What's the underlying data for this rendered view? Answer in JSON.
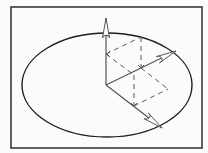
{
  "diagram": {
    "type": "vector-parallelepiped-in-ellipse",
    "colors": {
      "background": "#fbfbfb",
      "frame": "#3a3a3a",
      "ellipse": "#1e1e1e",
      "vector": "#555555",
      "dashed": "#5a5a5a",
      "arrowhead_fill": "#ffffff"
    },
    "frame": {
      "x": 11,
      "y": 7,
      "width": 191,
      "height": 141
    },
    "ellipse": {
      "cx": 107,
      "cy": 85,
      "rx": 85,
      "ry": 52
    },
    "origin": {
      "x": 106,
      "y": 85
    },
    "vectors": [
      {
        "name": "vertical-vector",
        "tip": {
          "x": 106,
          "y": 18
        }
      },
      {
        "name": "right-vector",
        "tip": {
          "x": 176,
          "y": 51
        }
      },
      {
        "name": "down-right-vector",
        "tip": {
          "x": 162,
          "y": 128
        }
      }
    ],
    "dashed_edges": [
      {
        "name": "a-to-ab",
        "x1": 106,
        "y1": 54,
        "x2": 141,
        "y2": 37
      },
      {
        "name": "ab-to-b",
        "x1": 141,
        "y1": 37,
        "x2": 141,
        "y2": 68
      },
      {
        "name": "a-to-ac",
        "x1": 106,
        "y1": 54,
        "x2": 134,
        "y2": 75
      },
      {
        "name": "ac-to-c",
        "x1": 134,
        "y1": 75,
        "x2": 134,
        "y2": 106
      },
      {
        "name": "b-to-bc",
        "x1": 141,
        "y1": 68,
        "x2": 168,
        "y2": 89
      },
      {
        "name": "c-to-bc",
        "x1": 134,
        "y1": 106,
        "x2": 168,
        "y2": 89
      }
    ],
    "ticks": [
      {
        "name": "tick-a",
        "x": 106,
        "y": 54,
        "dir": "right"
      },
      {
        "name": "tick-b",
        "x": 141,
        "y": 68,
        "dir": "down"
      },
      {
        "name": "tick-c",
        "x": 134,
        "y": 106,
        "dir": "down"
      }
    ]
  }
}
